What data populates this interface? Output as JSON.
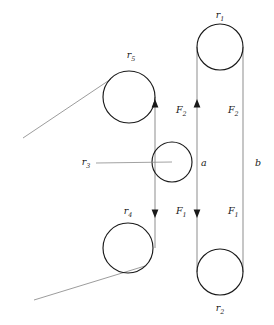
{
  "figure": {
    "type": "mechanical-diagram",
    "background_color": "#ffffff",
    "line_color": "#7a7a7a",
    "outline_color": "#1a1a1a",
    "text_color": "#1a1a1a"
  },
  "pulleys": [
    {
      "id": "r1",
      "symbol": "r",
      "subscript": "1",
      "cx": 220,
      "cy": 47,
      "r": 23,
      "label_x": 220,
      "label_y": 18
    },
    {
      "id": "r2",
      "symbol": "r",
      "subscript": "2",
      "cx": 220,
      "cy": 272,
      "r": 23,
      "label_x": 220,
      "label_y": 311
    },
    {
      "id": "r3",
      "symbol": "r",
      "subscript": "3",
      "cx": 172,
      "cy": 162,
      "r": 20,
      "label_x": 86,
      "label_y": 165
    },
    {
      "id": "r4",
      "symbol": "r",
      "subscript": "4",
      "cx": 128,
      "cy": 248,
      "r": 25,
      "label_x": 128,
      "label_y": 214
    },
    {
      "id": "r5",
      "symbol": "r",
      "subscript": "5",
      "cx": 129,
      "cy": 97,
      "r": 26,
      "label_x": 131,
      "label_y": 58
    }
  ],
  "belts": [
    {
      "id": "belt-a",
      "label": "a",
      "label_x": 201,
      "label_y": 166,
      "x": 155,
      "y_top": 97,
      "y_bottom": 248
    },
    {
      "id": "belt-b",
      "label": "b",
      "label_x": 255,
      "label_y": 166,
      "x": 243,
      "y_top": 47,
      "y_bottom": 272
    }
  ],
  "force_labels": [
    {
      "id": "f2-left",
      "symbol": "F",
      "subscript": "2",
      "direction": "up",
      "label_x": 176,
      "label_y": 113,
      "arrow_x": 155,
      "arrow_y": 105
    },
    {
      "id": "f2-right",
      "symbol": "F",
      "subscript": "2",
      "direction": "up",
      "label_x": 228,
      "label_y": 113,
      "arrow_x": 197,
      "arrow_y": 105
    },
    {
      "id": "f1-left",
      "symbol": "F",
      "subscript": "1",
      "direction": "down",
      "label_x": 176,
      "label_y": 214,
      "arrow_x": 155,
      "arrow_y": 212
    },
    {
      "id": "f1-right",
      "symbol": "F",
      "subscript": "1",
      "direction": "down",
      "label_x": 228,
      "label_y": 214,
      "arrow_x": 197,
      "arrow_y": 212
    }
  ],
  "diagonals": [
    {
      "id": "upper-diagonal",
      "x1": 23,
      "y1": 138,
      "x2": 111,
      "y2": 79
    },
    {
      "id": "lower-diagonal",
      "x1": 34,
      "y1": 300,
      "x2": 145,
      "y2": 266
    }
  ],
  "leader": {
    "id": "r3-leader",
    "x1": 96,
    "y1": 163,
    "x2": 172,
    "y2": 162
  }
}
